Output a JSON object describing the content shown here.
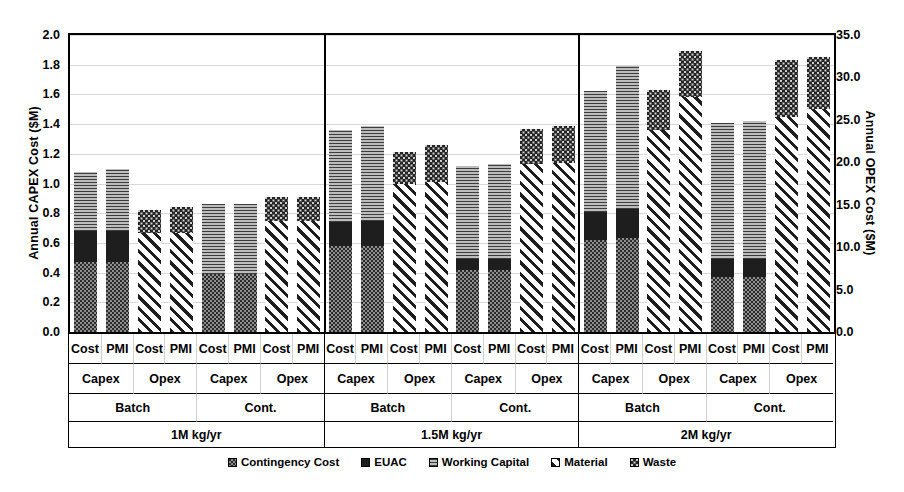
{
  "chart_data": {
    "type": "bar",
    "title": "",
    "subtype": "stacked-grouped",
    "ylabel": "Annual CAPEX Cost ($M)",
    "y2label": "Annual OPEX Cost ($M)",
    "xlabel": "",
    "ylim": [
      0.0,
      2.0
    ],
    "y2lim": [
      0.0,
      35.0
    ],
    "yticks": [
      "0.0",
      "0.2",
      "0.4",
      "0.6",
      "0.8",
      "1.0",
      "1.2",
      "1.4",
      "1.6",
      "1.8",
      "2.0"
    ],
    "y2ticks": [
      "0.0",
      "5.0",
      "10.0",
      "15.0",
      "20.0",
      "25.0",
      "30.0",
      "35.0"
    ],
    "grid": true,
    "legend_position": "bottom",
    "legend": [
      {
        "name": "Contingency Cost",
        "pattern": "checkerboard-dark"
      },
      {
        "name": "EUAC",
        "pattern": "solid-dark"
      },
      {
        "name": "Working Capital",
        "pattern": "horizontal-lines-gray"
      },
      {
        "name": "Material",
        "pattern": "diagonal-hatch"
      },
      {
        "name": "Waste",
        "pattern": "dotted-dark"
      }
    ],
    "axis_groups": {
      "level1_label": "Cost / PMI",
      "level2_label": "Capex / Opex",
      "level3_label": "Batch / Cont.",
      "level4_label": "Throughput"
    },
    "groups": [
      {
        "throughput": "1M kg/yr",
        "modes": [
          {
            "mode": "Batch",
            "panels": [
              {
                "panel": "Capex",
                "axis": "left",
                "bars": [
                  {
                    "label": "Cost",
                    "total": 1.08,
                    "segments": [
                      {
                        "name": "Contingency Cost",
                        "value": 0.47
                      },
                      {
                        "name": "EUAC",
                        "value": 0.21
                      },
                      {
                        "name": "Working Capital",
                        "value": 0.4
                      }
                    ]
                  },
                  {
                    "label": "PMI",
                    "total": 1.1,
                    "segments": [
                      {
                        "name": "Contingency Cost",
                        "value": 0.47
                      },
                      {
                        "name": "EUAC",
                        "value": 0.21
                      },
                      {
                        "name": "Working Capital",
                        "value": 0.42
                      }
                    ]
                  }
                ]
              },
              {
                "panel": "Opex",
                "axis": "right",
                "bars": [
                  {
                    "label": "Cost",
                    "total": 0.82,
                    "segments": [
                      {
                        "name": "Material",
                        "value": 0.67
                      },
                      {
                        "name": "Waste",
                        "value": 0.15
                      }
                    ]
                  },
                  {
                    "label": "PMI",
                    "total": 0.84,
                    "segments": [
                      {
                        "name": "Material",
                        "value": 0.67
                      },
                      {
                        "name": "Waste",
                        "value": 0.17
                      }
                    ]
                  }
                ]
              }
            ]
          },
          {
            "mode": "Cont.",
            "panels": [
              {
                "panel": "Capex",
                "axis": "left",
                "bars": [
                  {
                    "label": "Cost",
                    "total": 0.86,
                    "segments": [
                      {
                        "name": "Contingency Cost",
                        "value": 0.39
                      },
                      {
                        "name": "Working Capital",
                        "value": 0.47
                      }
                    ]
                  },
                  {
                    "label": "PMI",
                    "total": 0.86,
                    "segments": [
                      {
                        "name": "Contingency Cost",
                        "value": 0.39
                      },
                      {
                        "name": "Working Capital",
                        "value": 0.47
                      }
                    ]
                  }
                ]
              },
              {
                "panel": "Opex",
                "axis": "right",
                "bars": [
                  {
                    "label": "Cost",
                    "total": 0.91,
                    "segments": [
                      {
                        "name": "Material",
                        "value": 0.75
                      },
                      {
                        "name": "Waste",
                        "value": 0.16
                      }
                    ]
                  },
                  {
                    "label": "PMI",
                    "total": 0.91,
                    "segments": [
                      {
                        "name": "Material",
                        "value": 0.75
                      },
                      {
                        "name": "Waste",
                        "value": 0.16
                      }
                    ]
                  }
                ]
              }
            ]
          }
        ]
      },
      {
        "throughput": "1.5M kg/yr",
        "modes": [
          {
            "mode": "Batch",
            "panels": [
              {
                "panel": "Capex",
                "axis": "left",
                "bars": [
                  {
                    "label": "Cost",
                    "total": 1.36,
                    "segments": [
                      {
                        "name": "Contingency Cost",
                        "value": 0.58
                      },
                      {
                        "name": "EUAC",
                        "value": 0.16
                      },
                      {
                        "name": "Working Capital",
                        "value": 0.62
                      }
                    ]
                  },
                  {
                    "label": "PMI",
                    "total": 1.39,
                    "segments": [
                      {
                        "name": "Contingency Cost",
                        "value": 0.58
                      },
                      {
                        "name": "EUAC",
                        "value": 0.17
                      },
                      {
                        "name": "Working Capital",
                        "value": 0.64
                      }
                    ]
                  }
                ]
              },
              {
                "panel": "Opex",
                "axis": "right",
                "bars": [
                  {
                    "label": "Cost",
                    "total": 1.21,
                    "segments": [
                      {
                        "name": "Material",
                        "value": 1.0
                      },
                      {
                        "name": "Waste",
                        "value": 0.21
                      }
                    ]
                  },
                  {
                    "label": "PMI",
                    "total": 1.26,
                    "segments": [
                      {
                        "name": "Material",
                        "value": 1.01
                      },
                      {
                        "name": "Waste",
                        "value": 0.25
                      }
                    ]
                  }
                ]
              }
            ]
          },
          {
            "mode": "Cont.",
            "panels": [
              {
                "panel": "Capex",
                "axis": "left",
                "bars": [
                  {
                    "label": "Cost",
                    "total": 1.12,
                    "segments": [
                      {
                        "name": "Contingency Cost",
                        "value": 0.42
                      },
                      {
                        "name": "EUAC",
                        "value": 0.07
                      },
                      {
                        "name": "Working Capital",
                        "value": 0.63
                      }
                    ]
                  },
                  {
                    "label": "PMI",
                    "total": 1.13,
                    "segments": [
                      {
                        "name": "Contingency Cost",
                        "value": 0.42
                      },
                      {
                        "name": "EUAC",
                        "value": 0.07
                      },
                      {
                        "name": "Working Capital",
                        "value": 0.64
                      }
                    ]
                  }
                ]
              },
              {
                "panel": "Opex",
                "axis": "right",
                "bars": [
                  {
                    "label": "Cost",
                    "total": 1.37,
                    "segments": [
                      {
                        "name": "Material",
                        "value": 1.13
                      },
                      {
                        "name": "Waste",
                        "value": 0.24
                      }
                    ]
                  },
                  {
                    "label": "PMI",
                    "total": 1.39,
                    "segments": [
                      {
                        "name": "Material",
                        "value": 1.14
                      },
                      {
                        "name": "Waste",
                        "value": 0.25
                      }
                    ]
                  }
                ]
              }
            ]
          }
        ]
      },
      {
        "throughput": "2M kg/yr",
        "modes": [
          {
            "mode": "Batch",
            "panels": [
              {
                "panel": "Capex",
                "axis": "left",
                "bars": [
                  {
                    "label": "Cost",
                    "total": 1.62,
                    "segments": [
                      {
                        "name": "Contingency Cost",
                        "value": 0.62
                      },
                      {
                        "name": "EUAC",
                        "value": 0.19
                      },
                      {
                        "name": "Working Capital",
                        "value": 0.81
                      }
                    ]
                  },
                  {
                    "label": "PMI",
                    "total": 1.79,
                    "segments": [
                      {
                        "name": "Contingency Cost",
                        "value": 0.63
                      },
                      {
                        "name": "EUAC",
                        "value": 0.2
                      },
                      {
                        "name": "Working Capital",
                        "value": 0.96
                      }
                    ]
                  }
                ]
              },
              {
                "panel": "Opex",
                "axis": "right",
                "bars": [
                  {
                    "label": "Cost",
                    "total": 1.63,
                    "segments": [
                      {
                        "name": "Material",
                        "value": 1.36
                      },
                      {
                        "name": "Waste",
                        "value": 0.27
                      }
                    ]
                  },
                  {
                    "label": "PMI",
                    "total": 1.89,
                    "segments": [
                      {
                        "name": "Material",
                        "value": 1.58
                      },
                      {
                        "name": "Waste",
                        "value": 0.31
                      }
                    ]
                  }
                ]
              }
            ]
          },
          {
            "mode": "Cont.",
            "panels": [
              {
                "panel": "Capex",
                "axis": "left",
                "bars": [
                  {
                    "label": "Cost",
                    "total": 1.41,
                    "segments": [
                      {
                        "name": "Contingency Cost",
                        "value": 0.37
                      },
                      {
                        "name": "EUAC",
                        "value": 0.12
                      },
                      {
                        "name": "Working Capital",
                        "value": 0.92
                      }
                    ]
                  },
                  {
                    "label": "PMI",
                    "total": 1.42,
                    "segments": [
                      {
                        "name": "Contingency Cost",
                        "value": 0.37
                      },
                      {
                        "name": "EUAC",
                        "value": 0.12
                      },
                      {
                        "name": "Working Capital",
                        "value": 0.93
                      }
                    ]
                  }
                ]
              },
              {
                "panel": "Opex",
                "axis": "right",
                "bars": [
                  {
                    "label": "Cost",
                    "total": 1.83,
                    "segments": [
                      {
                        "name": "Material",
                        "value": 1.45
                      },
                      {
                        "name": "Waste",
                        "value": 0.38
                      }
                    ]
                  },
                  {
                    "label": "PMI",
                    "total": 1.85,
                    "segments": [
                      {
                        "name": "Material",
                        "value": 1.5
                      },
                      {
                        "name": "Waste",
                        "value": 0.35
                      }
                    ]
                  }
                ]
              }
            ]
          }
        ]
      }
    ]
  }
}
